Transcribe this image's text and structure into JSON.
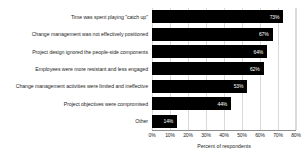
{
  "chart_data": {
    "type": "bar",
    "orientation": "horizontal",
    "title": "",
    "xlabel": "Percent of respondents",
    "ylabel": "",
    "xlim": [
      0,
      80
    ],
    "xtick_labels": [
      "0%",
      "10%",
      "20%",
      "30%",
      "40%",
      "50%",
      "60%",
      "70%",
      "80%"
    ],
    "xticks": [
      0,
      10,
      20,
      30,
      40,
      50,
      60,
      70,
      80
    ],
    "grid": true,
    "legend": "none",
    "bar_color": "#000000",
    "value_label_color": "#ffffff",
    "gridline_color": "#d9d9d9",
    "categories": [
      "Time was spent playing \"catch up\"",
      "Change management was not effectively positioned",
      "Project design ignored the people-side components",
      "Employees were more resistant and less engaged",
      "Change management activities were limited and ineffective",
      "Project objectives were compromised",
      "Other"
    ],
    "values": [
      73,
      67,
      64,
      62,
      53,
      44,
      14
    ],
    "value_labels": [
      "73%",
      "67%",
      "64%",
      "62%",
      "53%",
      "44%",
      "14%"
    ]
  }
}
